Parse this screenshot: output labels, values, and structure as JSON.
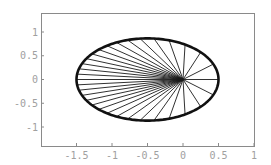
{
  "chart_data": {
    "type": "line",
    "title": "",
    "xlabel": "",
    "ylabel": "",
    "ellipse": {
      "semi_major_axis": 1.0,
      "eccentricity": 0.5,
      "center": [
        -0.5,
        0
      ],
      "focus": [
        0,
        0
      ],
      "x_extent": [
        -1.5,
        0.5
      ],
      "y_extent": [
        -0.866,
        0.866
      ]
    },
    "rays": {
      "count": 32,
      "origin": [
        0,
        0
      ],
      "spacing": "equal mean anomaly (equal time steps)"
    },
    "xlim": [
      -2.0,
      1.0
    ],
    "ylim": [
      -1.4,
      1.4
    ],
    "x_ticks": [
      -1.5,
      -1,
      -0.5,
      0,
      0.5,
      1
    ],
    "x_tick_labels": [
      "-1.5",
      "-1",
      "-0.5",
      "0",
      "0.5",
      "1"
    ],
    "y_ticks": [
      1,
      0.5,
      0,
      -0.5,
      -1
    ],
    "y_tick_labels": [
      "1",
      "0.5",
      "0",
      "-0.5",
      "-1"
    ],
    "grid": false,
    "legend": null
  },
  "colors": {
    "curve": "#111111",
    "rays": "#1a1a1a",
    "frame": "#8a8a8a",
    "labels": "#a0a0a0"
  }
}
